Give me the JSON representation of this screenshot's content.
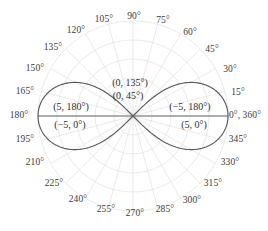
{
  "chart_data": {
    "type": "line",
    "subtype": "polar",
    "title": "",
    "xlabel": "",
    "ylabel": "",
    "curve_name": "lemniscate",
    "equation": "r^2 = 25 cos(2θ)",
    "max_radius": 5,
    "grid": true,
    "grid_circles": 5,
    "angle_step_deg": 15,
    "theta_range_deg": [
      0,
      360
    ],
    "legend": "none",
    "angle_tick_labels": [
      "0°, 360°",
      "15°",
      "30°",
      "45°",
      "60°",
      "75°",
      "90°",
      "105°",
      "120°",
      "135°",
      "150°",
      "165°",
      "180°",
      "195°",
      "210°",
      "225°",
      "240°",
      "255°",
      "270°",
      "285°",
      "300°",
      "315°",
      "330°",
      "345°"
    ],
    "angle_tick_values": [
      0,
      15,
      30,
      45,
      60,
      75,
      90,
      105,
      120,
      135,
      150,
      165,
      180,
      195,
      210,
      225,
      240,
      255,
      270,
      285,
      300,
      315,
      330,
      345
    ],
    "point_annotations": [
      {
        "label": "(0, 135°)",
        "r": 0,
        "theta": 135
      },
      {
        "label": "(0, 45°)",
        "r": 0,
        "theta": 45
      },
      {
        "label": "(5, 180°)",
        "r": 5,
        "theta": 180
      },
      {
        "label": "(−5, 0°)",
        "r": -5,
        "theta": 0
      },
      {
        "label": "(−5, 180°)",
        "r": -5,
        "theta": 180
      },
      {
        "label": "(5, 0°)",
        "r": 5,
        "theta": 0
      }
    ],
    "colors": {
      "curve": "#58585a",
      "grid": "#dcdcdc",
      "axis": "#58585a",
      "label_text": "#3b3b3b",
      "background": "#ffffff"
    }
  },
  "ticks": {
    "t0": "0°, 360°",
    "t15": "15°",
    "t30": "30°",
    "t45": "45°",
    "t60": "60°",
    "t75": "75°",
    "t90": "90°",
    "t105": "105°",
    "t120": "120°",
    "t135": "135°",
    "t150": "150°",
    "t165": "165°",
    "t180": "180°",
    "t195": "195°",
    "t210": "210°",
    "t225": "225°",
    "t240": "240°",
    "t255": "255°",
    "t270": "270°",
    "t285": "285°",
    "t300": "300°",
    "t315": "315°",
    "t330": "330°",
    "t345": "345°"
  },
  "annotations": {
    "a_0_135": "(0, 135°)",
    "a_0_45": "(0, 45°)",
    "a_5_180": "(5, 180°)",
    "a_n5_0": "(−5, 0°)",
    "a_n5_180": "(−5, 180°)",
    "a_5_0": "(5, 0°)"
  }
}
